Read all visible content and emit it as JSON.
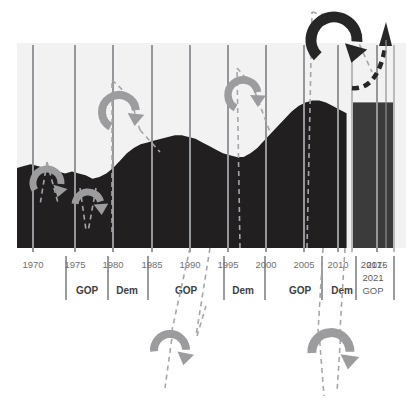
{
  "figure": {
    "title": "",
    "background_color": "#ffffff",
    "plot_background_color": "#f2f2f2",
    "area_color": "#211f20",
    "forecast_bar_color": "#3b3b3c",
    "gridline_color": "#9a9b9d",
    "annotation_color": "#9c9c9e",
    "annotation_dark_color": "#262626",
    "axis_label_color": "#6f7072"
  },
  "chart_data": {
    "type": "area",
    "title": "",
    "xlabel": "",
    "ylabel": "",
    "grid": true,
    "legend_position": "none",
    "xlim": [
      1968,
      2021
    ],
    "ylim": [
      0,
      100
    ],
    "x_tick_labels": [
      "1970",
      "1975",
      "1980",
      "1985",
      "1990",
      "1995",
      "2000",
      "2005",
      "2010",
      "2015",
      "2017-\n2021"
    ],
    "x_ticks": [
      1970,
      1975,
      1980,
      1985,
      1990,
      1995,
      2000,
      2005,
      2010,
      2015,
      2019
    ],
    "series": [
      {
        "name": "history",
        "type": "area",
        "x": [
          1968,
          1969,
          1970,
          1971,
          1972,
          1973,
          1974,
          1975,
          1976,
          1977,
          1978,
          1979,
          1980,
          1981,
          1982,
          1983,
          1984,
          1985,
          1986,
          1987,
          1988,
          1989,
          1990,
          1991,
          1992,
          1993,
          1994,
          1995,
          1996,
          1997,
          1998,
          1999,
          2000,
          2001,
          2002,
          2003,
          2004,
          2005,
          2006,
          2007,
          2008,
          2009,
          2010,
          2011,
          2012,
          2013,
          2014,
          2015,
          2016
        ],
        "values": [
          44,
          45,
          46,
          45,
          44,
          43,
          42,
          41,
          42,
          41,
          40,
          38,
          39,
          41,
          44,
          48,
          52,
          55,
          57,
          58,
          59,
          60,
          61,
          62,
          62,
          61,
          60,
          58,
          56,
          54,
          52,
          51,
          50,
          50,
          52,
          55,
          59,
          63,
          67,
          71,
          75,
          78,
          80,
          81,
          81,
          80,
          78,
          76,
          74
        ]
      },
      {
        "name": "2017-2021 GOP",
        "type": "bar",
        "x": [
          2019
        ],
        "values": [
          80
        ],
        "color": "#3b3b3c"
      }
    ]
  },
  "axis": {
    "tick_labels": [
      {
        "id": "t1970",
        "text": "1970"
      },
      {
        "id": "t1975",
        "text": "1975"
      },
      {
        "id": "t1980",
        "text": "1980"
      },
      {
        "id": "t1985",
        "text": "1985"
      },
      {
        "id": "t1990",
        "text": "1990"
      },
      {
        "id": "t1995",
        "text": "1995"
      },
      {
        "id": "t2000",
        "text": "2000"
      },
      {
        "id": "t2005",
        "text": "2005"
      },
      {
        "id": "t2010",
        "text": "2010"
      },
      {
        "id": "t2015",
        "text": "2015"
      }
    ],
    "final_period_line1": "2017-",
    "final_period_line2": "2021"
  },
  "party_bands": [
    {
      "id": "band-gop-1",
      "label": "GOP"
    },
    {
      "id": "band-dem-1",
      "label": "Dem"
    },
    {
      "id": "band-gop-2",
      "label": "GOP"
    },
    {
      "id": "band-dem-2",
      "label": "Dem"
    },
    {
      "id": "band-gop-3",
      "label": "GOP"
    },
    {
      "id": "band-dem-3",
      "label": "Dem"
    },
    {
      "id": "band-gop-4",
      "label": "GOP"
    }
  ],
  "annotations": [
    {
      "id": "loop-1",
      "kind": "curved-arrow",
      "tone": "light"
    },
    {
      "id": "loop-2",
      "kind": "curved-arrow",
      "tone": "light"
    },
    {
      "id": "loop-3",
      "kind": "curved-arrow",
      "tone": "light"
    },
    {
      "id": "loop-4",
      "kind": "curved-arrow",
      "tone": "light"
    },
    {
      "id": "loop-5",
      "kind": "curved-arrow",
      "tone": "light"
    },
    {
      "id": "loop-6",
      "kind": "curved-arrow",
      "tone": "dark"
    },
    {
      "id": "loop-7",
      "kind": "curved-arrow",
      "tone": "light"
    },
    {
      "id": "loop-8",
      "kind": "curved-arrow",
      "tone": "light"
    },
    {
      "id": "arrow-up-right",
      "kind": "straight-arrow",
      "tone": "dark"
    }
  ]
}
